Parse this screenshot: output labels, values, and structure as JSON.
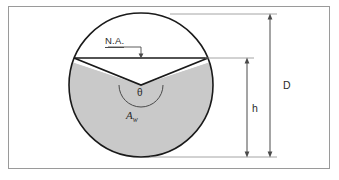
{
  "figure": {
    "type": "engineering-cross-section-diagram",
    "colors": {
      "frame_border": "#9a9a9a",
      "circle_outline": "#1a1a1a",
      "water_fill": "#c9c9c9",
      "chord_line": "#1a1a1a",
      "dimension_line": "#4a4a4a",
      "label_text": "#2b2b2b",
      "background": "#ffffff"
    },
    "labels": {
      "neutral_axis": "N.A.",
      "angle": "θ",
      "wetted_area": "A",
      "wetted_area_subscript": "w",
      "diameter": "D",
      "depth": "h"
    },
    "geometry": {
      "circle_center_x": 141,
      "circle_center_y": 85,
      "circle_radius": 72,
      "circle_top_y": 13,
      "circle_bottom_y": 157,
      "chord_y": 58,
      "vertex_x": 141,
      "vertex_y": 85,
      "chord_left_x": 74,
      "chord_right_x": 208,
      "arc_radius": 22,
      "dimension_line_d_x": 270,
      "dimension_line_h_x": 247,
      "dimension_d_top_y": 14,
      "dimension_d_bottom_y": 157,
      "dimension_h_top_y": 58,
      "dimension_h_bottom_y": 157
    },
    "annotations": {
      "na_leader_start_x": 108,
      "na_leader_end_x": 141,
      "na_leader_y": 47,
      "na_arrow_tip_y": 57
    }
  }
}
